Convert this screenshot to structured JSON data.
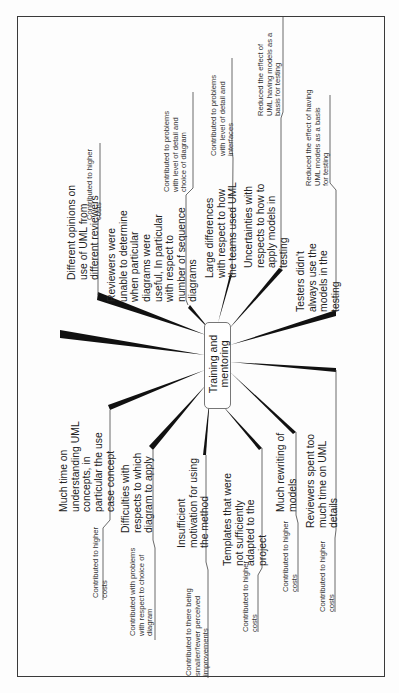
{
  "diagram": {
    "type": "mind-map",
    "orientation": "rotated 90 degrees counter-clockwise",
    "center": {
      "label": "Training and\nmentoring"
    },
    "branches": [
      {
        "id": "much-time-uml-concepts",
        "cause": "Much time on\nunderstanding UML\nconcepts, in\nparticular the use\ncase concept",
        "effect": "Contributed to higher\ncosts"
      },
      {
        "id": "difficulties-which-diagram",
        "cause": "Difficulties with\nrespects to which\ndiagram to apply",
        "effect": "Contributed with problems\nwith respect to choice of\ndiagram"
      },
      {
        "id": "insufficient-motivation",
        "cause": "Insufficient\nmotivation for using\nthe method",
        "effect": "Contributed to there being\nsmaller/fewer perceived\nimprovements"
      },
      {
        "id": "templates-not-adapted",
        "cause": "Templates that were\nnot sufficiently\nadapted to the\nproject",
        "effect": "Contributed to higher\ncosts"
      },
      {
        "id": "much-rewriting",
        "cause": "Much rewriting of\nmodels",
        "effect": "Contributed to higher\ncosts"
      },
      {
        "id": "reviewers-uml-details",
        "cause": "Reviewers spent too\nmuch time on UML\ndetails",
        "effect": "Contributed to higher\ncosts"
      },
      {
        "id": "different-opinions",
        "cause": "Different opinions on\nuse of UML from\ndifferent reviewers",
        "effect": "Contributed to higher\ncosts"
      },
      {
        "id": "reviewers-unable",
        "cause": "Reviewers were\nunable to determine\nwhen particular\ndiagrams were\nuseful, In particular\nwith respect to\nnumber of sequence\ndiagrams",
        "effect": "Contributed to problems\nwith level of detail and\nchoice of diagram"
      },
      {
        "id": "large-differences",
        "cause": "Large differences\nwith respect to how\nthe teams used UML",
        "effect": "Contributed to problems\nwith level of detail and\ninterfaces"
      },
      {
        "id": "uncertainties-testing",
        "cause": "Uncertainties with\nrespects to how to\napply models in\ntesting",
        "effect": "Reduced the effect of\nUML having models as a\nbasis for testing"
      },
      {
        "id": "testers-didnt-use",
        "cause": "Testers didn't\nalways use the\nmodels in the\ntesting",
        "effect": "Reduced the effect of having\nUML models as a basis\nfor testing"
      }
    ]
  },
  "colors": {
    "background": "#fdfdfd",
    "ink": "#1a1a1a",
    "frame": "#3a3a3a",
    "node_border": "#777777"
  }
}
